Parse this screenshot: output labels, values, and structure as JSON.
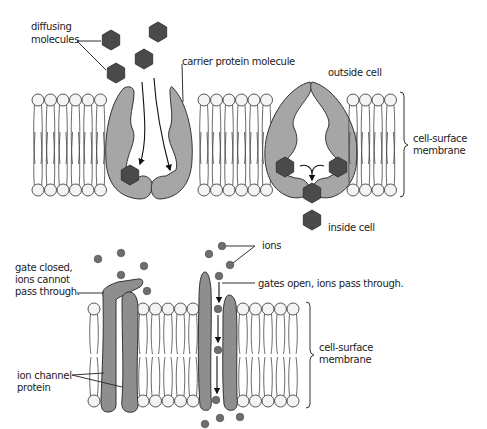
{
  "diagram": {
    "top_panel": {
      "title": "Facilitated diffusion via carrier protein",
      "labels": {
        "diffusing_molecules_line1": "diffusing",
        "diffusing_molecules_line2": "molecules",
        "carrier_protein": "carrier protein molecule",
        "outside_cell": "outside cell",
        "inside_cell": "inside cell",
        "membrane_line1": "cell-surface",
        "membrane_line2": "membrane"
      }
    },
    "bottom_panel": {
      "title": "Facilitated diffusion via ion channel protein",
      "labels": {
        "ions": "ions",
        "gate_closed_line1": "gate closed,",
        "gate_closed_line2": "ions cannot",
        "gate_closed_line3": "pass through.",
        "gates_open": "gates open, ions pass through.",
        "ion_channel_line1": "ion channel",
        "ion_channel_line2": "protein",
        "membrane_line1": "cell-surface",
        "membrane_line2": "membrane"
      }
    },
    "colors": {
      "protein": "#a6a6a6",
      "channel_protein": "#8e8e8e",
      "molecule": "#4a4a4a",
      "ion": "#6e6e6e",
      "lipid_head": "#f4f4f4"
    }
  }
}
